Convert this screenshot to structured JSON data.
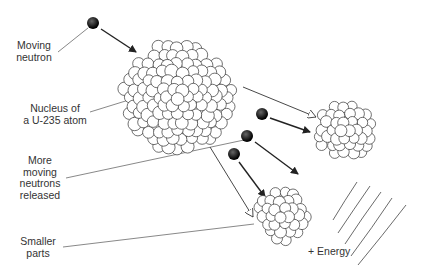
{
  "labels": {
    "moving_neutron": [
      "Moving",
      "neutron"
    ],
    "nucleus": [
      "Nucleus of",
      "a U-235 atom"
    ],
    "more_neutrons": [
      "More",
      "moving",
      "neutrons",
      "released"
    ],
    "smaller_parts": [
      "Smaller",
      "parts"
    ],
    "energy": "+ Energy"
  },
  "colors": {
    "line": "#333333",
    "neutron": "#111111",
    "nucleon_fill": "#ffffff"
  }
}
